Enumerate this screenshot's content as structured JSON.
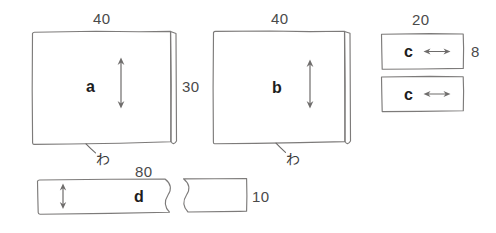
{
  "diagram": {
    "kind": "sewing-pattern-cutting-layout",
    "pieces": [
      {
        "id": "a",
        "label": "a",
        "fill": "#e3e3e1",
        "width_label": "40",
        "height_label": "30",
        "fold_label": "わ",
        "has_vertical_arrow": true,
        "has_selvage_strip": true
      },
      {
        "id": "b",
        "label": "b",
        "fill": "#ffffff",
        "width_label": "40",
        "height_label": "",
        "fold_label": "わ",
        "has_vertical_arrow": true,
        "has_selvage_strip": true
      },
      {
        "id": "c1",
        "label": "c",
        "fill": "#ffffff",
        "width_label": "20",
        "height_label": "8",
        "has_horizontal_arrow": true
      },
      {
        "id": "c2",
        "label": "c",
        "fill": "#ffffff",
        "width_label": "",
        "height_label": "",
        "has_horizontal_arrow": true
      },
      {
        "id": "d",
        "label": "d",
        "fill": "#e3e3e1",
        "width_label": "80",
        "height_label": "10",
        "has_vertical_arrow": true,
        "has_break_line": true
      }
    ],
    "dimensions": {
      "a_width": "40",
      "a_height": "30",
      "b_width": "40",
      "c_width": "20",
      "c_height": "8",
      "d_width": "80",
      "d_height": "10"
    },
    "fold_marks": {
      "a": "わ",
      "b": "わ"
    },
    "colors": {
      "shaded_fabric": "#e3e3e1",
      "plain_fabric": "#ffffff",
      "outline": "#7d7b7a",
      "text": "#3a3a3a",
      "label_text": "#1d1d1d",
      "page_background": "#ffffff"
    }
  }
}
